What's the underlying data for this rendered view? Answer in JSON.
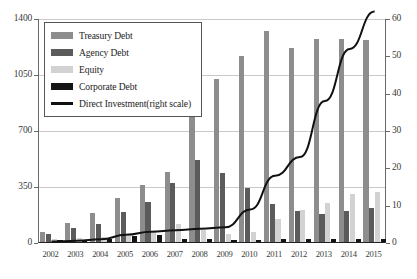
{
  "legend": {
    "position": "top-left",
    "items": [
      {
        "key": "treasury",
        "label": "Treasury Debt",
        "marker": "swatch",
        "color": "#8d8d8d"
      },
      {
        "key": "agency",
        "label": "Agency Debt",
        "marker": "swatch",
        "color": "#5b5b5b"
      },
      {
        "key": "equity",
        "label": "Equity",
        "marker": "swatch",
        "color": "#d2d2d2"
      },
      {
        "key": "corporate",
        "label": "Corporate Debt",
        "marker": "swatch",
        "color": "#141414"
      },
      {
        "key": "direct",
        "label": "Direct Investment(right scale)",
        "marker": "line",
        "color": "#111111"
      }
    ]
  },
  "axes": {
    "left_ticks": [
      "0",
      "350",
      "700",
      "1050",
      "1400"
    ],
    "right_ticks": [
      "0",
      "10",
      "20",
      "30",
      "40",
      "50",
      "60"
    ],
    "x_ticks": [
      "2002",
      "2003",
      "2004",
      "2005",
      "2006",
      "2007",
      "2008",
      "2009",
      "2010",
      "2011",
      "2012",
      "2013",
      "2014",
      "2015"
    ]
  },
  "chart_data": {
    "type": "bar",
    "title": "",
    "xlabel": "",
    "ylabel": "",
    "ylim": [
      0,
      1400
    ],
    "ylim_right": [
      0,
      60
    ],
    "grid": true,
    "legend_position": "top-left",
    "categories": [
      "2002",
      "2003",
      "2004",
      "2005",
      "2006",
      "2007",
      "2008",
      "2009",
      "2010",
      "2011",
      "2012",
      "2013",
      "2014",
      "2015"
    ],
    "series": [
      {
        "name": "Treasury Debt",
        "type": "bar",
        "axis": "left",
        "color": "#8d8d8d",
        "values": [
          60,
          120,
          180,
          275,
          355,
          440,
          870,
          1020,
          1160,
          1320,
          1210,
          1270,
          1270,
          1265
        ]
      },
      {
        "name": "Agency Debt",
        "type": "bar",
        "axis": "left",
        "color": "#5b5b5b",
        "values": [
          50,
          85,
          115,
          190,
          250,
          370,
          510,
          430,
          340,
          240,
          195,
          175,
          195,
          215
        ]
      },
      {
        "name": "Equity",
        "type": "bar",
        "axis": "left",
        "color": "#d2d2d2",
        "values": [
          20,
          25,
          30,
          40,
          60,
          110,
          75,
          50,
          65,
          145,
          200,
          245,
          300,
          310
        ]
      },
      {
        "name": "Corporate Debt",
        "type": "bar",
        "axis": "left",
        "color": "#141414",
        "values": [
          12,
          14,
          18,
          40,
          45,
          20,
          18,
          15,
          14,
          16,
          18,
          18,
          20,
          20
        ]
      },
      {
        "name": "Direct Investment(right scale)",
        "type": "line",
        "axis": "right",
        "color": "#111111",
        "values": [
          0.4,
          0.6,
          1.0,
          2.2,
          3.0,
          3.4,
          3.8,
          4.2,
          9.0,
          18.0,
          23.0,
          38.0,
          52.0,
          62.0
        ]
      }
    ]
  }
}
